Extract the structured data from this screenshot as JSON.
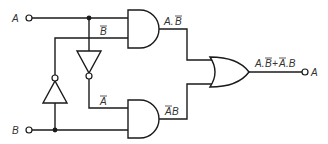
{
  "diagram": {
    "type": "logic-circuit",
    "function": "XOR",
    "inputs": [
      {
        "id": "A",
        "label": "A"
      },
      {
        "id": "B",
        "label": "B"
      }
    ],
    "output": {
      "label": "A",
      "expression": "A.B̄+Ā.B"
    },
    "gates": [
      {
        "id": "not-b",
        "type": "NOT",
        "input": "B",
        "output_label": "B̄"
      },
      {
        "id": "not-a",
        "type": "NOT",
        "input": "A",
        "output_label": "Ā"
      },
      {
        "id": "and-1",
        "type": "AND",
        "inputs": [
          "A",
          "B̄"
        ],
        "output_label": "A.B̄"
      },
      {
        "id": "and-2",
        "type": "AND",
        "inputs": [
          "Ā",
          "B"
        ],
        "output_label": "ĀB"
      },
      {
        "id": "or-1",
        "type": "OR",
        "inputs": [
          "A.B̄",
          "ĀB"
        ],
        "output_label": "A.B̄+Ā.B"
      }
    ]
  },
  "labels": {
    "input_a": "A",
    "input_b": "B",
    "b_bar": "B",
    "a_bar": "A",
    "and1_out_a": "A.",
    "and1_out_b": "B",
    "and2_out_a": "A",
    "and2_out_b": "B",
    "or_out_1": "A.",
    "or_out_2": "B",
    "or_out_3": "+",
    "or_out_4": "A",
    "or_out_5": ".B",
    "output": "A"
  },
  "colors": {
    "line": "#1a1a1a",
    "text": "#333333",
    "background": "#ffffff"
  }
}
